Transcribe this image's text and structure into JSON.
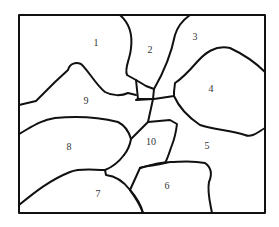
{
  "diagram": {
    "type": "region-map",
    "regions": [
      {
        "id": "1",
        "label": "1",
        "x": 96,
        "y": 43
      },
      {
        "id": "2",
        "label": "2",
        "x": 150,
        "y": 50
      },
      {
        "id": "3",
        "label": "3",
        "x": 195,
        "y": 37
      },
      {
        "id": "4",
        "label": "4",
        "x": 211,
        "y": 89
      },
      {
        "id": "5",
        "label": "5",
        "x": 207,
        "y": 146
      },
      {
        "id": "6",
        "label": "6",
        "x": 167,
        "y": 186
      },
      {
        "id": "7",
        "label": "7",
        "x": 98,
        "y": 194
      },
      {
        "id": "8",
        "label": "8",
        "x": 69,
        "y": 147
      },
      {
        "id": "9",
        "label": "9",
        "x": 86,
        "y": 101
      },
      {
        "id": "10",
        "label": "10",
        "x": 151,
        "y": 142
      }
    ],
    "colors": {
      "stroke": "#111111",
      "background": "#ffffff",
      "label": "#333333"
    }
  }
}
